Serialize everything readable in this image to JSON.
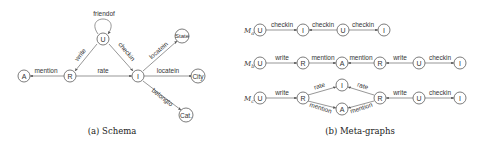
{
  "schema": {
    "caption": "(a) Schema",
    "nodes": {
      "U": "U",
      "R": "R",
      "A": "A",
      "I": "I",
      "State": "State",
      "City": "City",
      "Cat": "Cat."
    },
    "edges": {
      "friendof": "friendof",
      "write": "write",
      "checkin": "checkin",
      "mention": "mention",
      "rate": "rate",
      "locatein_state": "locatein",
      "locatein_city": "locatein",
      "belongto": "belongto"
    }
  },
  "metagraphs": {
    "caption": "(b) Meta-graphs",
    "Ma": {
      "label": "Mₐ:",
      "nodes": [
        "U",
        "I",
        "U",
        "I"
      ],
      "edges": [
        "checkin",
        "checkin",
        "checkin"
      ]
    },
    "Mb": {
      "label": "Mᵦ:",
      "nodes": [
        "U",
        "R",
        "A",
        "R",
        "U",
        "I"
      ],
      "edges": [
        "write",
        "mention",
        "mention",
        "write",
        "checkin"
      ]
    },
    "Mc": {
      "label": "Mc:",
      "nodes": [
        "U",
        "R",
        "I",
        "A",
        "R",
        "U",
        "I"
      ],
      "edges": [
        "write",
        "rate",
        "mention",
        "rate",
        "mention",
        "write",
        "checkin"
      ]
    }
  }
}
